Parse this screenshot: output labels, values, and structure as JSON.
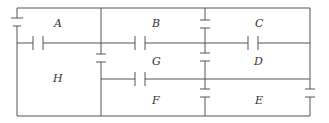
{
  "diagram": {
    "type": "circuit",
    "regions": [
      {
        "id": "A",
        "label": "A",
        "x": 58,
        "y": 27
      },
      {
        "id": "B",
        "label": "B",
        "x": 155,
        "y": 27
      },
      {
        "id": "C",
        "label": "C",
        "x": 258,
        "y": 27
      },
      {
        "id": "D",
        "label": "D",
        "x": 258,
        "y": 65
      },
      {
        "id": "E",
        "label": "E",
        "x": 258,
        "y": 104
      },
      {
        "id": "F",
        "label": "F",
        "x": 155,
        "y": 104
      },
      {
        "id": "G",
        "label": "G",
        "x": 155,
        "y": 65
      },
      {
        "id": "H",
        "label": "H",
        "x": 58,
        "y": 82
      }
    ],
    "colors": {
      "line": "#555555",
      "text": "#333333",
      "background": "#ffffff"
    }
  }
}
